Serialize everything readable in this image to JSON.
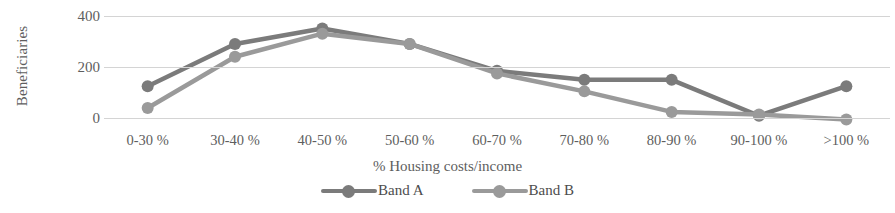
{
  "chart_data": {
    "type": "line",
    "title": "",
    "xlabel": "% Housing costs/income",
    "ylabel": "Beneficiaries",
    "categories": [
      "0-30 %",
      "30-40 %",
      "40-50 %",
      "50-60 %",
      "60-70 %",
      "70-80 %",
      "80-90 %",
      "90-100 %",
      ">100 %"
    ],
    "series": [
      {
        "name": "Band A",
        "color": "#7b7b7b",
        "values": [
          125,
          290,
          350,
          290,
          185,
          150,
          150,
          10,
          125
        ]
      },
      {
        "name": "Band B",
        "color": "#9a9a9a",
        "values": [
          40,
          240,
          330,
          290,
          175,
          105,
          25,
          15,
          -5
        ]
      }
    ],
    "yticks": [
      0,
      200,
      400
    ],
    "ylim": [
      -30,
      430
    ],
    "grid": true,
    "legend_position": "bottom",
    "gridline_color": "#d4d4d4"
  }
}
